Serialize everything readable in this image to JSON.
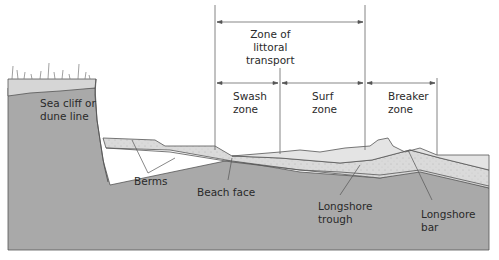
{
  "diagram": {
    "colors": {
      "background": "#ffffff",
      "bedrock": "#a9a9a9",
      "sand": "#d8d8d8",
      "water": "#e6e6e6",
      "topsoil": "#d4d4d4",
      "line": "#4a4a4a",
      "text": "#2a2a2a"
    },
    "zones": {
      "littoral_transport": "Zone of\nlittoral\ntransport",
      "swash": "Swash\nzone",
      "surf": "Surf\nzone",
      "breaker": "Breaker\nzone"
    },
    "features": {
      "sea_cliff": "Sea cliff or\ndune line",
      "berms": "Berms",
      "beach_face": "Beach face",
      "longshore_trough": "Longshore\ntrough",
      "longshore_bar": "Longshore\nbar"
    }
  }
}
